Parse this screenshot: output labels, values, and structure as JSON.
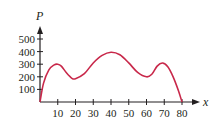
{
  "chart_data": {
    "type": "line",
    "title": "",
    "xlabel": "x",
    "ylabel": "P",
    "xlim": [
      0,
      80
    ],
    "ylim": [
      0,
      500
    ],
    "grid": false,
    "legend": null,
    "x_ticks": [
      10,
      20,
      30,
      40,
      50,
      60,
      70,
      80
    ],
    "y_ticks": [
      100,
      200,
      300,
      400,
      500
    ],
    "series": [
      {
        "name": "P(x)",
        "color": "#c8284a",
        "x": [
          0,
          2,
          5,
          8,
          10,
          12,
          15,
          18,
          20,
          25,
          30,
          35,
          40,
          45,
          50,
          55,
          60,
          63,
          66,
          69,
          72,
          75,
          78,
          80
        ],
        "values": [
          0,
          150,
          255,
          295,
          300,
          285,
          230,
          188,
          185,
          225,
          310,
          370,
          395,
          375,
          310,
          235,
          200,
          220,
          285,
          310,
          280,
          200,
          90,
          0
        ]
      }
    ]
  },
  "labels": {
    "y_axis": "P",
    "x_axis": "x",
    "y_ticks": [
      "100",
      "200",
      "300",
      "400",
      "500"
    ],
    "x_ticks": [
      "10",
      "20",
      "30",
      "40",
      "50",
      "60",
      "70",
      "80"
    ]
  }
}
